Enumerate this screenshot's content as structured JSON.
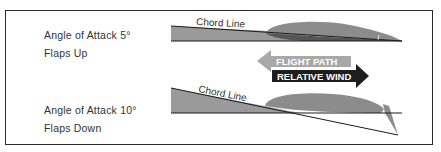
{
  "diagram": {
    "panel_top": {
      "title": "Angle of Attack 5°",
      "subtitle": "Flaps Up",
      "chord_label": "Chord Line",
      "angle_deg": 5,
      "flaps": "up"
    },
    "panel_bottom": {
      "title": "Angle of Attack 10°",
      "subtitle": "Flaps Down",
      "chord_label": "Chord Line",
      "angle_deg": 10,
      "flaps": "down"
    },
    "arrows": {
      "flight_path": "FLIGHT  PATH",
      "relative_wind": "RELATIVE WIND"
    },
    "colors": {
      "airfoil_fill": "#8c8c8c",
      "wedge_fill": "#9a9a9a",
      "line": "#1a1a1a",
      "flight_path_arrow": "#a8a8a8",
      "relative_wind_arrow": "#1e1e1e",
      "frame": "#2a2a2a",
      "text": "#333333"
    }
  }
}
